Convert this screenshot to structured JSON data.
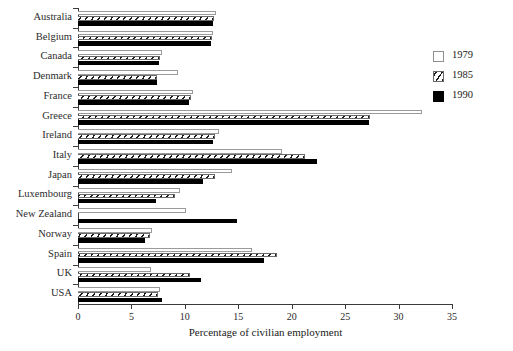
{
  "chart_data": {
    "type": "bar",
    "orientation": "horizontal",
    "title": "",
    "xlabel": "Percentage of  civilian employment",
    "ylabel": "",
    "xlim": [
      0,
      35
    ],
    "xticks": [
      0,
      5,
      10,
      15,
      20,
      25,
      30,
      35
    ],
    "xticklabels": [
      "0",
      "5",
      "10",
      "15",
      "20",
      "25",
      "30",
      "35"
    ],
    "grid": false,
    "legend_position": "right",
    "categories": [
      "Australia",
      "Belgium",
      "Canada",
      "Denmark",
      "France",
      "Greece",
      "Ireland",
      "Italy",
      "Japan",
      "Luxembourg",
      "New Zealand",
      "Norway",
      "Spain",
      "UK",
      "USA"
    ],
    "series": [
      {
        "name": "1979",
        "color": "#ffffff",
        "pattern": "empty",
        "values": [
          12.9,
          12.6,
          7.9,
          9.4,
          10.8,
          32.2,
          13.2,
          19.1,
          14.4,
          9.5,
          10.1,
          6.9,
          16.3,
          6.8,
          7.7
        ]
      },
      {
        "name": "1985",
        "color": "#ffffff",
        "pattern": "diagonal-hatch",
        "values": [
          12.7,
          12.5,
          7.7,
          7.4,
          10.6,
          27.3,
          12.8,
          21.2,
          12.8,
          9.1,
          0.0,
          6.7,
          18.6,
          10.5,
          7.5
        ]
      },
      {
        "name": "1990",
        "color": "#000000",
        "pattern": "solid",
        "values": [
          12.6,
          12.4,
          7.6,
          7.4,
          10.4,
          27.2,
          12.6,
          22.4,
          11.7,
          7.3,
          14.9,
          6.3,
          17.4,
          11.5,
          7.9
        ]
      }
    ],
    "legend_entries": [
      "1979",
      "1985",
      "1990"
    ]
  }
}
